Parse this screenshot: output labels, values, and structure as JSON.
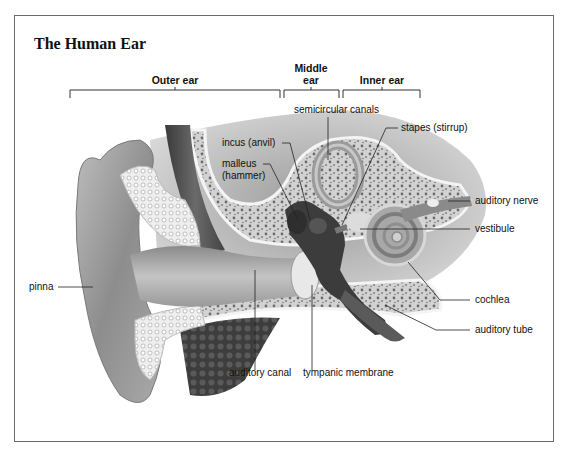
{
  "title": "The Human Ear",
  "sections": {
    "outer": "Outer ear",
    "middle_line1": "Middle",
    "middle_line2": "ear",
    "inner": "Inner ear"
  },
  "labels": {
    "semicircular_canals": "semicircular canals",
    "stapes": "stapes (stirrup)",
    "incus": "incus (anvil)",
    "malleus_line1": "malleus",
    "malleus_line2": "(hammer)",
    "auditory_nerve": "auditory nerve",
    "vestibule": "vestibule",
    "pinna": "pinna",
    "cochlea": "cochlea",
    "auditory_tube": "auditory tube",
    "auditory_canal": "auditory canal",
    "tympanic_membrane": "tympanic membrane"
  }
}
